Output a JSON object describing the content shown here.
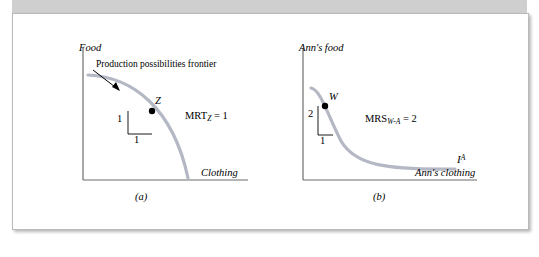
{
  "figure": {
    "panels": [
      {
        "id": "a",
        "caption": "(a)",
        "y_axis_label": "Food",
        "x_axis_label": "Clothing",
        "curve_label": "Production possibilities frontier",
        "point_label": "Z",
        "rise_label": "1",
        "run_label": "1",
        "equation": "MRT",
        "equation_sub": "Z",
        "equation_rest": " = 1"
      },
      {
        "id": "b",
        "caption": "(b)",
        "y_axis_label": "Ann's food",
        "x_axis_label": "Ann's clothing",
        "curve_label": "I",
        "curve_label_sup": "A",
        "point_label": "W",
        "rise_label": "2",
        "run_label": "1",
        "equation": "MRS",
        "equation_sub": "W-A",
        "equation_rest": " = 2"
      }
    ],
    "colors": {
      "curve": "#b3b8c4",
      "axis": "#6d6d6d",
      "point": "#000000",
      "card_border": "#b9b9b9",
      "band": "#cfcfcf"
    }
  }
}
